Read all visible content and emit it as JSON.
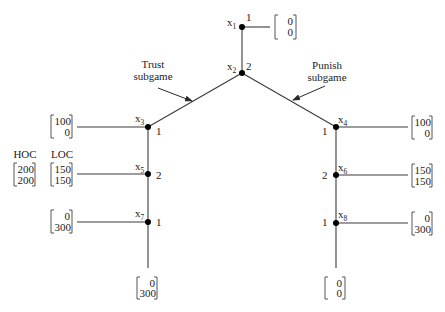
{
  "figure": {
    "nodes": [
      {
        "name": "x",
        "sub": "1",
        "player": "1"
      },
      {
        "name": "x",
        "sub": "2",
        "player": "2"
      },
      {
        "name": "x",
        "sub": "3",
        "player": "1"
      },
      {
        "name": "x",
        "sub": "4",
        "player": "1"
      },
      {
        "name": "x",
        "sub": "5",
        "player": "2"
      },
      {
        "name": "x",
        "sub": "6",
        "player": "2"
      },
      {
        "name": "x",
        "sub": "7",
        "player": "1"
      },
      {
        "name": "x",
        "sub": "8",
        "player": "1"
      }
    ],
    "payoffs": {
      "x1_exit": [
        "0",
        "0"
      ],
      "x3_left": [
        "100",
        "0"
      ],
      "x5_left_hoc": [
        "200",
        "200"
      ],
      "x5_left_loc": [
        "150",
        "150"
      ],
      "x7_left": [
        "0",
        "300"
      ],
      "x7_down": [
        "0",
        "300"
      ],
      "x4_right": [
        "100",
        "0"
      ],
      "x6_right": [
        "150",
        "150"
      ],
      "x8_right": [
        "0",
        "300"
      ],
      "x8_down": [
        "0",
        "0"
      ]
    },
    "annotations": {
      "trust": {
        "line1": "Trust",
        "line2": "subgame"
      },
      "punish": {
        "line1": "Punish",
        "line2": "subgame"
      },
      "hoc": "HOC",
      "loc": "LOC"
    }
  }
}
